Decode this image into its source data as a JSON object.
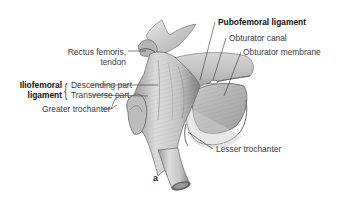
{
  "figure": {
    "panel_label": "a",
    "labels": {
      "rectus_femoris_line1": "Rectus femoris,",
      "rectus_femoris_line2": "tendon",
      "iliofemoral_line1": "Iliofemoral",
      "iliofemoral_line2": "ligament",
      "descending_part": "Descending part",
      "transverse_part": "Transverse part",
      "greater_trochanter": "Greater trochanter",
      "pubofemoral_ligament": "Pubofemoral ligament",
      "obturator_canal": "Obturator canal",
      "obturator_membrane": "Obturator membrane",
      "lesser_trochanter": "Lesser trochanter"
    },
    "colors": {
      "background": "#ffffff",
      "text": "#3a3a3a",
      "leader_line": "#333333",
      "bone_light": "#e6e6e6",
      "bone_dark": "#8a8a8a"
    }
  }
}
